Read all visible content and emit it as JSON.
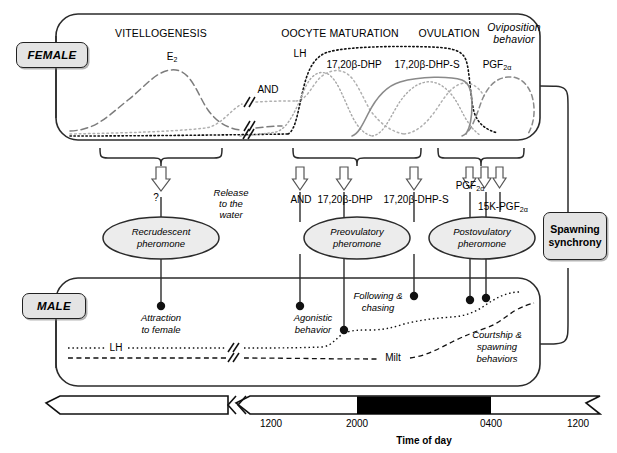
{
  "diagram": {
    "title_axis": "Time of day",
    "female_tag": "FEMALE",
    "male_tag": "MALE",
    "spawning_line1": "Spawning",
    "spawning_line2": "synchrony"
  },
  "female": {
    "stages": [
      {
        "label": "VITELLOGENESIS",
        "x": 161,
        "y": 28,
        "style": "caps"
      },
      {
        "label": "OOCYTE MATURATION",
        "x": 340,
        "y": 28,
        "style": "caps"
      },
      {
        "label": "OVULATION",
        "x": 449,
        "y": 28,
        "style": "caps"
      },
      {
        "label": "Oviposition",
        "x": 514,
        "y": 26,
        "style": "italic"
      },
      {
        "label": "behavior",
        "x": 514,
        "y": 37,
        "style": "italic"
      }
    ],
    "curve_labels": [
      {
        "label": "E",
        "sub": "2",
        "x": 172,
        "y": 55
      },
      {
        "label": "AND",
        "sub": "",
        "x": 258,
        "y": 86
      },
      {
        "label": "LH",
        "sub": "",
        "x": 300,
        "y": 51
      },
      {
        "label": "17,20β-DHP",
        "sub": "",
        "x": 352,
        "y": 62
      },
      {
        "label": "17,20β-DHP-S",
        "sub": "",
        "x": 424,
        "y": 62
      },
      {
        "label": "PGF",
        "sub": "2α",
        "x": 497,
        "y": 62
      }
    ]
  },
  "pheromones": [
    {
      "name_line1": "Recrudescent",
      "name_line2": "pheromone",
      "cx": 161,
      "cy": 238
    },
    {
      "name_line1": "Preovulatory",
      "name_line2": "pheromone",
      "cx": 357,
      "cy": 238
    },
    {
      "name_line1": "Postovulatory",
      "name_line2": "pheromone",
      "cx": 482,
      "cy": 238
    }
  ],
  "release": {
    "line1": "Release",
    "line2": "to the",
    "line3": "water",
    "question_mark": "?"
  },
  "signals": [
    {
      "label": "AND",
      "sub": "",
      "x": 301,
      "y": 198
    },
    {
      "label": "17,20β-DHP",
      "sub": "",
      "x": 344,
      "y": 198
    },
    {
      "label": "17,20β-DHP-S",
      "sub": "",
      "x": 415,
      "y": 198
    },
    {
      "label": "PGF",
      "sub": "2α",
      "x": 470,
      "y": 184
    },
    {
      "label": "15K-PGF",
      "sub": "2α",
      "x": 501,
      "y": 205
    }
  ],
  "male": {
    "behaviors": [
      {
        "line1": "Attraction",
        "line2": "to female",
        "x": 161,
        "y": 312
      },
      {
        "line1": "Agonistic",
        "line2": "behavior",
        "x": 313,
        "y": 312
      },
      {
        "line1": "Following &",
        "line2": "chasing",
        "x": 376,
        "y": 294
      },
      {
        "line1": "Courtship &",
        "line2": "spawning",
        "line3": "behaviors",
        "x": 497,
        "y": 336
      }
    ],
    "trace_labels": [
      {
        "label": "LH",
        "x": 114,
        "y": 348
      },
      {
        "label": "Milt",
        "x": 393,
        "y": 359
      }
    ]
  },
  "axis": {
    "ticks": [
      {
        "label": "1200",
        "x": 271
      },
      {
        "label": "2000",
        "x": 357
      },
      {
        "label": "0400",
        "x": 491
      },
      {
        "label": "1200",
        "x": 578
      }
    ],
    "night_start_x": 357,
    "night_end_x": 491
  },
  "colors": {
    "stroke": "#1a1a1a",
    "box_fill": "#e4e4e4",
    "curve_gray": "#8f8f8f",
    "curve_light": "#b5b5b5",
    "night": "#000000"
  }
}
